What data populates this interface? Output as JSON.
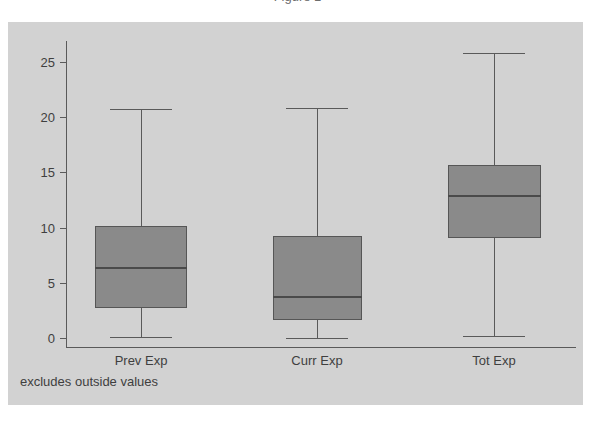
{
  "header": {
    "cropped_title": "Figure 1"
  },
  "figure": {
    "footnote": "excludes outside values",
    "background_color": "#d2d2d2",
    "box_fill_color": "#8a8a8a",
    "line_color": "#5a5a5a"
  },
  "chart_data": {
    "type": "boxplot",
    "title": "",
    "xlabel": "",
    "ylabel": "",
    "ylim": [
      -1.5,
      27.5
    ],
    "yticks": [
      0,
      5,
      10,
      15,
      20,
      25
    ],
    "ytick_labels": [
      "0",
      "5",
      "10",
      "15",
      "20",
      "25"
    ],
    "grid": false,
    "legend": "none",
    "note": "excludes outside values",
    "categories": [
      "Prev Exp",
      "Curr Exp",
      "Tot Exp"
    ],
    "boxes": [
      {
        "label": "Prev Exp",
        "whisker_low": 0.1,
        "q1": 2.7,
        "median": 6.3,
        "q3": 10.1,
        "whisker_high": 20.7
      },
      {
        "label": "Curr Exp",
        "whisker_low": 0.0,
        "q1": 1.6,
        "median": 3.7,
        "q3": 9.2,
        "whisker_high": 20.8
      },
      {
        "label": "Tot Exp",
        "whisker_low": 0.2,
        "q1": 9.1,
        "median": 12.9,
        "q3": 15.7,
        "whisker_high": 25.8
      }
    ]
  }
}
